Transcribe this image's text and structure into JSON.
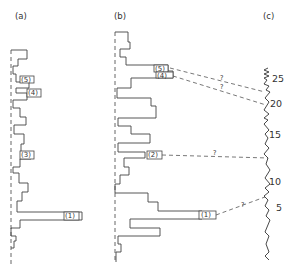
{
  "figure": {
    "panels": [
      {
        "id": "a",
        "label": "(a)"
      },
      {
        "id": "b",
        "label": "(b)"
      },
      {
        "id": "c",
        "label": "(c)"
      }
    ],
    "panel_a_markers": [
      {
        "id": "5",
        "label": "(5)"
      },
      {
        "id": "4",
        "label": "(4)"
      },
      {
        "id": "3",
        "label": "(3)"
      },
      {
        "id": "1",
        "label": "(1)"
      }
    ],
    "panel_b_markers": [
      {
        "id": "5",
        "label": "(5)"
      },
      {
        "id": "4",
        "label": "(4)"
      },
      {
        "id": "2",
        "label": "(2)"
      },
      {
        "id": "1",
        "label": "(1)"
      }
    ],
    "scale_c": {
      "ticks": [
        "25",
        "20",
        "15",
        "10",
        "5"
      ]
    },
    "correlations": [
      {
        "from": "b-5",
        "to": "c-near-22",
        "label": "?"
      },
      {
        "from": "b-4",
        "to": "c-near-19",
        "label": "?"
      },
      {
        "from": "b-2",
        "to": "c-near-12",
        "label": "?"
      },
      {
        "from": "b-1",
        "to": "c-near-7",
        "label": "?"
      }
    ]
  }
}
